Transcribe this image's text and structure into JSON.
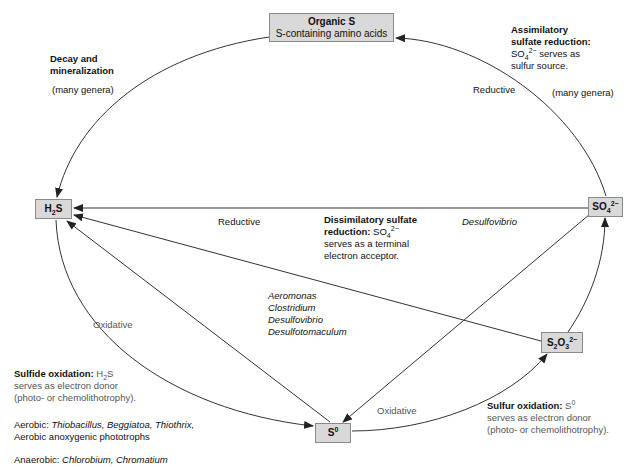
{
  "nodes": {
    "organic_s": {
      "title": "Organic S",
      "subtitle": "S-containing amino acids"
    },
    "h2s": {
      "base": "H",
      "sub": "2",
      "tail": "S"
    },
    "so4": {
      "base": "SO",
      "sub": "4",
      "sup": "2−"
    },
    "s2o3": {
      "a": "S",
      "sub1": "2",
      "b": "O",
      "sub2": "3",
      "sup": "2−"
    },
    "s0": {
      "base": "S",
      "sup": "0"
    }
  },
  "labels": {
    "decay": {
      "title_line1": "Decay and",
      "title_line2": "mineralization",
      "genera": "(many genera)"
    },
    "assimilatory": {
      "title_line1": "Assimilatory",
      "title_line2": "sulfate reduction:",
      "desc_so": "SO",
      "desc_sub": "4",
      "desc_sup": "2−",
      "desc_rest": " serves as",
      "desc_line2": "sulfur source.",
      "reductive": "Reductive",
      "genera": "(many genera)"
    },
    "dissimilatory": {
      "reductive": "Reductive",
      "title_line1": "Dissimilatory sulfate",
      "title_line2": "reduction:",
      "so": " SO",
      "sub": "4",
      "sup": "2−",
      "line3": "serves as a terminal",
      "line4": "electron acceptor.",
      "organism": "Desulfovibrio"
    },
    "organisms_middle": [
      "Aeromonas",
      "Clostridium",
      "Desulfovibrio",
      "Desulfotomaculum"
    ],
    "oxidative_left": "Oxidative",
    "oxidative_bottom": "Oxidative",
    "sulfide_oxidation": {
      "title": "Sulfide oxidation:",
      "h": " H",
      "sub": "2",
      "s": "S",
      "line2": "serves as electron donor",
      "line3": "(photo- or chemolithotrophy)."
    },
    "aerobic": {
      "prefix": "Aerobic: ",
      "genera": "Thiobacillus, Beggiatoa, Thiothrix,",
      "line2": "Aerobic anoxygenic phototrophs"
    },
    "anaerobic": {
      "prefix": "Anaerobic: ",
      "genera": "Chlorobium, Chromatium"
    },
    "sulfur_oxidation": {
      "title": "Sulfur oxidation:",
      "s": " S",
      "sup": "0",
      "line2": "serves as electron donor",
      "line3": "(photo- or chemolithotrophy)."
    }
  },
  "colors": {
    "box_fill": "#d9d9d9",
    "box_border": "#8a8a8a",
    "line": "#333333",
    "gray_text": "#555555"
  }
}
